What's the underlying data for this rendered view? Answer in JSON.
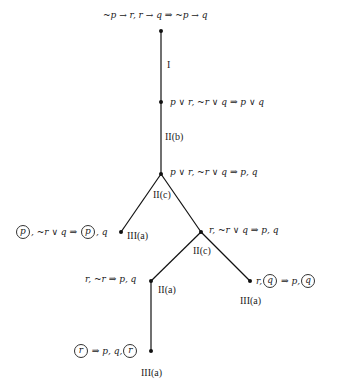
{
  "nodes": [
    {
      "id": "n1",
      "x": 161,
      "y": 31,
      "sequent": "~p → r, r → q  ⇒  ~p → q"
    },
    {
      "id": "n2",
      "x": 161,
      "y": 102,
      "sequent": "p ∨ r, ~r ∨ q  ⇒  p ∨ q"
    },
    {
      "id": "n3",
      "x": 161,
      "y": 174,
      "sequent": "p ∨ r, ~r ∨ q  ⇒  p, q"
    },
    {
      "id": "n4",
      "x": 121,
      "y": 232,
      "sequent_parts": [
        "p",
        ", ~r ∨ q  ⇒ ",
        "p",
        ", q"
      ],
      "leaf": true
    },
    {
      "id": "n5",
      "x": 201,
      "y": 232,
      "sequent": "r, ~r ∨ q  ⇒  p, q"
    },
    {
      "id": "n6",
      "x": 151,
      "y": 281,
      "sequent": "r, ~r  ⇒  p, q"
    },
    {
      "id": "n7",
      "x": 250,
      "y": 281,
      "sequent_parts": [
        "r,",
        "q",
        " ⇒  p,",
        "q"
      ],
      "leaf": true
    },
    {
      "id": "n8",
      "x": 151,
      "y": 351,
      "sequent_parts": [
        "r",
        " ⇒  p, q,",
        "r"
      ],
      "leaf": true
    }
  ],
  "edges": [
    {
      "from": "n1",
      "to": "n2"
    },
    {
      "from": "n2",
      "to": "n3"
    },
    {
      "from": "n3",
      "to": "n4"
    },
    {
      "from": "n3",
      "to": "n5"
    },
    {
      "from": "n5",
      "to": "n6"
    },
    {
      "from": "n5",
      "to": "n7"
    },
    {
      "from": "n6",
      "to": "n8"
    }
  ],
  "rules": {
    "r1": "I",
    "r2": "II(b)",
    "r3": "II(c)",
    "r4": "III(a)",
    "r5": "II(c)",
    "r6": "II(a)",
    "r7": "III(a)",
    "r8": "III(a)"
  },
  "labels": {
    "n1": "~p → r, r → q  ⇒  ~p → q",
    "n2": "p ∨ r, ~r ∨ q  ⇒  p ∨ q",
    "n3": "p ∨ r, ~r ∨ q  ⇒  p, q",
    "n4_a": "p",
    "n4_b": ", ~r ∨ q  ⇒ ",
    "n4_c": "p",
    "n4_d": ", q",
    "n5": "r, ~r ∨ q  ⇒  p, q",
    "n6": "r, ~r  ⇒  p, q",
    "n7_a": "r,",
    "n7_b": "q",
    "n7_c": "  ⇒  p,",
    "n7_d": "q",
    "n8_a": "r",
    "n8_b": "  ⇒  p, q,",
    "n8_c": "r"
  },
  "style": {
    "line_color": "#111111",
    "text_color": "#222222",
    "background": "#ffffff"
  }
}
